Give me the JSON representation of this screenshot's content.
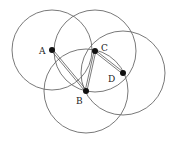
{
  "diagram": {
    "stroke_color": "#6a6a6a",
    "point_color": "#111111",
    "points": [
      {
        "label": "A",
        "x": 52,
        "y": 50,
        "r": 40,
        "lx": 39,
        "ly": 54
      },
      {
        "label": "C",
        "x": 95,
        "y": 51,
        "r": 41,
        "lx": 101,
        "ly": 51
      },
      {
        "label": "D",
        "x": 123,
        "y": 73,
        "r": 42,
        "lx": 108,
        "ly": 82
      },
      {
        "label": "B",
        "x": 86,
        "y": 91,
        "r": 42,
        "lx": 76,
        "ly": 104
      }
    ],
    "segments": [
      [
        "A",
        "B"
      ],
      [
        "B",
        "C"
      ],
      [
        "C",
        "D"
      ]
    ]
  }
}
